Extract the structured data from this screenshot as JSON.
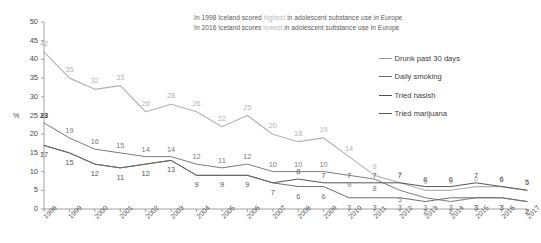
{
  "annotation": {
    "line1_pre": "In 1998 Iceland scored ",
    "line1_em": "highest",
    "line1_post": " in adolescent substance use in Europe",
    "line2_pre": "In 2016 Iceland scores ",
    "line2_em": "lowest",
    "line2_post": " in adolescent substance use in Europe"
  },
  "legend": {
    "position": "right",
    "items": [
      {
        "label": "Drunk past 30 days",
        "color": "#b3b3b3"
      },
      {
        "label": "Daily smoking",
        "color": "#7d7d7d"
      },
      {
        "label": "Tried hasish",
        "color": "#565656"
      },
      {
        "label": "Tried marijuana",
        "color": "#6d6d6d"
      }
    ]
  },
  "axis": {
    "y_unit": "%",
    "y_ticks": [
      "0",
      "5",
      "10",
      "15",
      "20",
      "25",
      "30",
      "35",
      "40",
      "45",
      "50"
    ]
  },
  "chart_data": {
    "type": "line",
    "title": "",
    "xlabel": "",
    "ylabel": "%",
    "ylim": [
      0,
      50
    ],
    "ystep": 5,
    "grid": false,
    "legend_position": "right",
    "categories": [
      "1998",
      "1999",
      "2000",
      "2001",
      "2002",
      "2003",
      "2004",
      "2005",
      "2006",
      "2007",
      "2008",
      "2009",
      "2010",
      "2011",
      "2012",
      "2013",
      "2014",
      "2015",
      "2016",
      "2017"
    ],
    "series": [
      {
        "name": "Drunk past 30 days",
        "color": "#b3b3b3",
        "values": [
          42,
          35,
          32,
          33,
          26,
          28,
          26,
          22,
          25,
          20,
          18,
          19,
          14,
          9,
          7,
          5,
          5,
          6,
          6,
          5
        ]
      },
      {
        "name": "Daily smoking",
        "color": "#7d7d7d",
        "values": [
          23,
          19,
          16,
          15,
          14,
          14,
          12,
          11,
          12,
          10,
          10,
          10,
          9,
          8,
          5,
          3,
          2,
          3,
          3,
          2
        ]
      },
      {
        "name": "Tried hasish",
        "color": "#565656",
        "values": [
          17,
          15,
          12,
          11,
          12,
          13,
          9,
          9,
          9,
          7,
          8,
          7,
          7,
          7,
          7,
          6,
          6,
          7,
          6,
          5
        ]
      },
      {
        "name": "Tried marijuana",
        "color": "#6d6d6d",
        "values": [
          17,
          15,
          12,
          11,
          12,
          13,
          9,
          9,
          9,
          7,
          6,
          6,
          3,
          3,
          3,
          2,
          3,
          3,
          3,
          2
        ]
      }
    ]
  }
}
